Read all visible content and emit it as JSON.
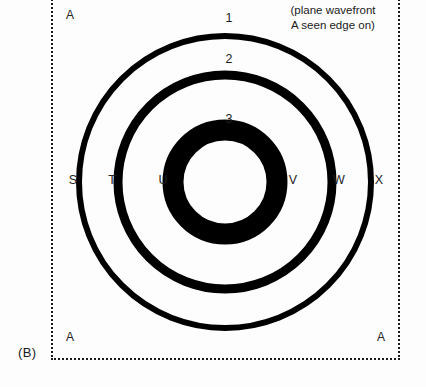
{
  "figure": {
    "panel_label": "(B)",
    "caption_line1": "(plane wavefront",
    "caption_line2": "A seen edge on)",
    "background_color": "#fdfdfd",
    "ink_color": "#000000",
    "frame_style": "dotted"
  },
  "corner_markers": {
    "top_left": "A",
    "bottom_left": "A",
    "bottom_right": "A"
  },
  "ring_numbers": {
    "outer": "1",
    "middle": "2",
    "inner": "3"
  },
  "axis_labels": {
    "s": "S",
    "t": "T",
    "u": "U",
    "v": "V",
    "w": "W",
    "x": "X"
  },
  "chart_data": {
    "type": "scatter",
    "xlabel": "",
    "ylabel": "",
    "center": {
      "x": 225,
      "y": 182
    },
    "series": [
      {
        "name": "1",
        "radius": 146,
        "stroke_width": 6,
        "label": "1",
        "left_point": "S",
        "right_point": "X"
      },
      {
        "name": "2",
        "radius": 107,
        "stroke_width": 9,
        "label": "2",
        "left_point": "T",
        "right_point": "W"
      },
      {
        "name": "3",
        "radius": 52,
        "stroke_width": 21,
        "label": "3",
        "left_point": "U",
        "right_point": "V"
      }
    ],
    "annotations": [
      {
        "text": "A",
        "position": "top-left"
      },
      {
        "text": "A",
        "position": "bottom-left"
      },
      {
        "text": "A",
        "position": "bottom-right"
      },
      {
        "text": "(plane wavefront A seen edge on)",
        "position": "top-right"
      },
      {
        "text": "(B)",
        "position": "outside-bottom-left"
      }
    ],
    "grid": false,
    "legend": "none"
  }
}
